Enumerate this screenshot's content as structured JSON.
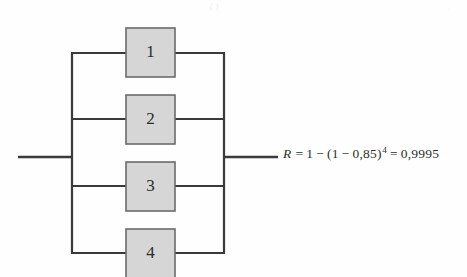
{
  "diagram": {
    "type": "reliability-block-diagram",
    "colors": {
      "block_fill": "#d6d6d6",
      "block_border": "#6b6b6b",
      "wire": "#3a3a3a",
      "text": "#2e2e2e",
      "background": "#fefefe"
    },
    "blocks": [
      {
        "label": "1",
        "x": 126,
        "y": 28,
        "width": 49,
        "height": 49
      },
      {
        "label": "2",
        "x": 126,
        "y": 95,
        "width": 49,
        "height": 49
      },
      {
        "label": "3",
        "x": 126,
        "y": 162,
        "width": 49,
        "height": 49
      },
      {
        "label": "4",
        "x": 126,
        "y": 229,
        "width": 49,
        "height": 49
      }
    ],
    "rails": {
      "left_x": 72,
      "right_x": 224,
      "top_y": 53,
      "bottom_y": 253
    },
    "branch_wire_y": [
      53,
      119,
      186,
      253
    ],
    "input_wire": {
      "x1": 18,
      "x2": 73,
      "y": 157
    },
    "output_wire": {
      "x1": 223,
      "x2": 278,
      "y": 157
    }
  },
  "formula": {
    "variable": "R",
    "equals": "=",
    "one": "1",
    "minus": "−",
    "open_paren": "(",
    "inner_one": "1",
    "inner_minus": "−",
    "component_reliability": "0,85",
    "close_paren": ")",
    "exponent": "4",
    "equals_2": "=",
    "result": "0,9995",
    "full_text": "R = 1 − (1 − 0,85)⁴ = 0,9995"
  },
  "artifacts": {
    "top_left_mark": "( )",
    "top_right_mark": "."
  }
}
